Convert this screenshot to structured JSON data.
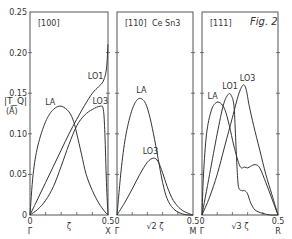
{
  "chart_data": {
    "type": "line",
    "title": "Fig. 2",
    "material": "Ce Sn3",
    "ylabel_line1": "|T_Q|",
    "ylabel_line2": "(Å)",
    "ylim": [
      0,
      0.25
    ],
    "yticks": [
      {
        "value": 0,
        "label": "0"
      },
      {
        "value": 0.05,
        "label": "0.05"
      },
      {
        "value": 0.1,
        "label": "0.10"
      },
      {
        "value": 0.15,
        "label": "0.15"
      },
      {
        "value": 0.2,
        "label": "0.20"
      },
      {
        "value": 0.25,
        "label": "0.25"
      }
    ],
    "panels": [
      {
        "direction": "[100]",
        "xlim": [
          0,
          0.5
        ],
        "x_start_label": "0",
        "x_start_point": "Γ",
        "x_end_label": "0.5",
        "x_end_point": "X",
        "x_axis_label": "ζ",
        "x_minor_ticks": [
          0.1,
          0.2,
          0.3,
          0.4
        ],
        "series": [
          {
            "name": "LA",
            "label_at": [
              0.13,
              0.135
            ],
            "x": [
              0,
              0.02,
              0.05,
              0.1,
              0.15,
              0.2,
              0.25,
              0.28,
              0.3,
              0.33,
              0.36,
              0.4,
              0.44,
              0.48,
              0.5
            ],
            "y": [
              0,
              0.05,
              0.085,
              0.115,
              0.13,
              0.134,
              0.127,
              0.115,
              0.1,
              0.075,
              0.05,
              0.03,
              0.015,
              0.004,
              0
            ]
          },
          {
            "name": "LO1",
            "label_at": [
              0.42,
              0.168
            ],
            "x": [
              0,
              0.05,
              0.1,
              0.15,
              0.2,
              0.25,
              0.3,
              0.35,
              0.4,
              0.44,
              0.47,
              0.49,
              0.5
            ],
            "y": [
              0,
              0.02,
              0.04,
              0.06,
              0.08,
              0.1,
              0.118,
              0.135,
              0.15,
              0.158,
              0.165,
              0.18,
              0.21
            ]
          },
          {
            "name": "LO3",
            "label_at": [
              0.45,
              0.137
            ],
            "x": [
              0,
              0.05,
              0.1,
              0.15,
              0.2,
              0.25,
              0.3,
              0.35,
              0.4,
              0.45,
              0.47,
              0.48,
              0.49,
              0.5
            ],
            "y": [
              0,
              0.007,
              0.018,
              0.035,
              0.06,
              0.087,
              0.11,
              0.123,
              0.13,
              0.134,
              0.13,
              0.1,
              0.04,
              0
            ]
          }
        ]
      },
      {
        "direction": "[110]",
        "xlim": [
          0,
          0.5
        ],
        "x_start_label": "0",
        "x_start_point": "Γ",
        "x_end_label": "0.5",
        "x_end_point": "M",
        "x_axis_label": "√2 ζ",
        "x_minor_ticks": [
          0.1,
          0.2,
          0.3,
          0.4
        ],
        "series": [
          {
            "name": "LA",
            "label_at": [
              0.16,
              0.15
            ],
            "x": [
              0,
              0.03,
              0.06,
              0.1,
              0.14,
              0.18,
              0.21,
              0.24,
              0.27,
              0.3,
              0.33,
              0.37,
              0.42,
              0.47,
              0.5
            ],
            "y": [
              0,
              0.06,
              0.1,
              0.13,
              0.143,
              0.14,
              0.125,
              0.1,
              0.07,
              0.04,
              0.02,
              0.008,
              0.002,
              0,
              0
            ]
          },
          {
            "name": "LO3",
            "label_at": [
              0.22,
              0.075
            ],
            "x": [
              0,
              0.05,
              0.1,
              0.15,
              0.2,
              0.24,
              0.27,
              0.3,
              0.33,
              0.37,
              0.42,
              0.47,
              0.5
            ],
            "y": [
              0,
              0.015,
              0.032,
              0.05,
              0.065,
              0.07,
              0.066,
              0.052,
              0.035,
              0.018,
              0.007,
              0.002,
              0
            ]
          }
        ]
      },
      {
        "direction": "[111]",
        "xlim": [
          0,
          0.5
        ],
        "x_start_label": "0",
        "x_start_point": "Γ",
        "x_end_label": "0.5",
        "x_end_point": "R",
        "x_axis_label": "√3 ζ",
        "x_minor_ticks": [
          0.1,
          0.2,
          0.3,
          0.4
        ],
        "series": [
          {
            "name": "LA",
            "label_at": [
              0.07,
              0.143
            ],
            "x": [
              0,
              0.01,
              0.03,
              0.06,
              0.09,
              0.12,
              0.15,
              0.18,
              0.21,
              0.25,
              0.28,
              0.3,
              0.32,
              0.35,
              0.38,
              0.42,
              0.46,
              0.5
            ],
            "y": [
              0,
              0.05,
              0.1,
              0.128,
              0.138,
              0.138,
              0.13,
              0.11,
              0.085,
              0.06,
              0.059,
              0.058,
              0.06,
              0.062,
              0.058,
              0.04,
              0.02,
              0
            ]
          },
          {
            "name": "LO1",
            "label_at": [
              0.185,
              0.155
            ],
            "x": [
              0,
              0.05,
              0.1,
              0.14,
              0.17,
              0.19,
              0.21,
              0.22,
              0.23,
              0.24,
              0.26,
              0.28,
              0.3,
              0.32,
              0.35,
              0.4,
              0.45,
              0.5
            ],
            "y": [
              0,
              0.05,
              0.1,
              0.135,
              0.148,
              0.148,
              0.135,
              0.1,
              0.06,
              0.035,
              0.03,
              0.03,
              0.026,
              0.015,
              0.006,
              0.002,
              0,
              0
            ]
          },
          {
            "name": "LO3",
            "label_at": [
              0.3,
              0.165
            ],
            "x": [
              0,
              0.05,
              0.1,
              0.15,
              0.2,
              0.24,
              0.27,
              0.29,
              0.31,
              0.34,
              0.38,
              0.42,
              0.46,
              0.5
            ],
            "y": [
              0,
              0.022,
              0.05,
              0.085,
              0.12,
              0.148,
              0.16,
              0.155,
              0.135,
              0.11,
              0.08,
              0.05,
              0.025,
              0
            ]
          }
        ]
      }
    ]
  }
}
